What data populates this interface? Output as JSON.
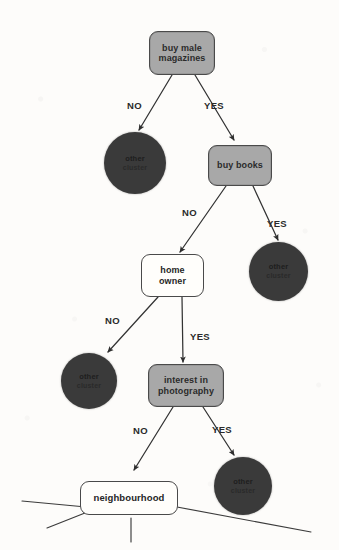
{
  "diagram": {
    "type": "decision-tree",
    "background_color": "#fdfcfa",
    "colors": {
      "decision_node_fill": "#a8a8a8",
      "leaf_node_fill": "#3a3a3a",
      "hollow_node_fill": "#fffefb",
      "stroke": "#333333",
      "text": "#2a2a2a"
    },
    "nodes": [
      {
        "id": "buy-male-magazines",
        "label": "buy male magazines",
        "line1": "buy male",
        "line2": "magazines",
        "shape": "rounded-rect",
        "style": "filled"
      },
      {
        "id": "other-cluster-1",
        "label": "other cluster",
        "line1": "other",
        "line2": "cluster",
        "shape": "circle",
        "style": "leaf"
      },
      {
        "id": "buy-books",
        "label": "buy books",
        "line1": "buy books",
        "line2": "",
        "shape": "rounded-rect",
        "style": "filled"
      },
      {
        "id": "other-cluster-2",
        "label": "other cluster",
        "line1": "other",
        "line2": "cluster",
        "shape": "circle",
        "style": "leaf"
      },
      {
        "id": "home-owner",
        "label": "home owner",
        "line1": "home",
        "line2": "owner",
        "shape": "rounded-rect",
        "style": "hollow"
      },
      {
        "id": "other-cluster-3",
        "label": "other cluster",
        "line1": "other",
        "line2": "cluster",
        "shape": "circle",
        "style": "leaf"
      },
      {
        "id": "interest-in-photography",
        "label": "interest in photography",
        "line1": "interest in",
        "line2": "photography",
        "shape": "rounded-rect",
        "style": "filled"
      },
      {
        "id": "other-cluster-4",
        "label": "other cluster",
        "line1": "other",
        "line2": "cluster",
        "shape": "circle",
        "style": "leaf"
      },
      {
        "id": "neighbourhood",
        "label": "neighbourhood",
        "line1": "neighbourhood",
        "line2": "",
        "shape": "rounded-rect",
        "style": "hollow"
      }
    ],
    "edges": [
      {
        "from": "buy-male-magazines",
        "to": "other-cluster-1",
        "label": "NO"
      },
      {
        "from": "buy-male-magazines",
        "to": "buy-books",
        "label": "YES"
      },
      {
        "from": "buy-books",
        "to": "home-owner",
        "label": "NO"
      },
      {
        "from": "buy-books",
        "to": "other-cluster-2",
        "label": "YES"
      },
      {
        "from": "home-owner",
        "to": "other-cluster-3",
        "label": "NO"
      },
      {
        "from": "home-owner",
        "to": "interest-in-photography",
        "label": "YES"
      },
      {
        "from": "interest-in-photography",
        "to": "neighbourhood",
        "label": "NO"
      },
      {
        "from": "interest-in-photography",
        "to": "other-cluster-4",
        "label": "YES"
      },
      {
        "from": "neighbourhood",
        "to": "",
        "label": ""
      },
      {
        "from": "neighbourhood",
        "to": "",
        "label": ""
      },
      {
        "from": "neighbourhood",
        "to": "",
        "label": ""
      },
      {
        "from": "neighbourhood",
        "to": "",
        "label": ""
      }
    ]
  }
}
